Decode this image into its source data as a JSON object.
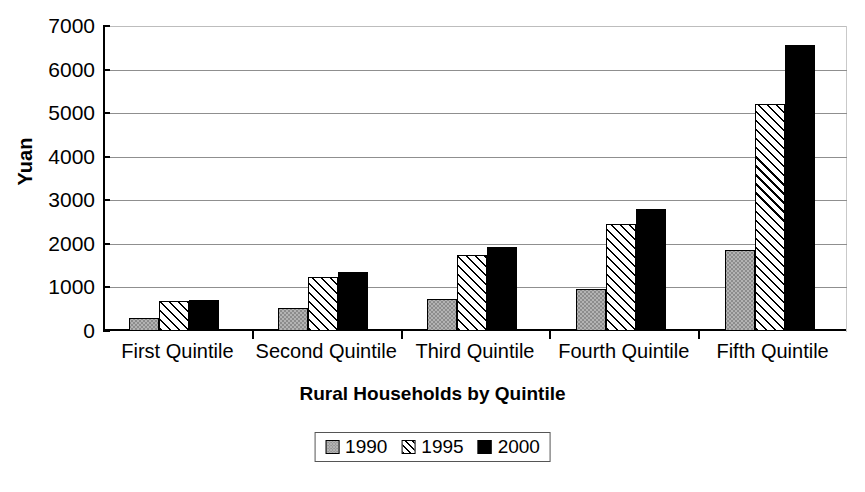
{
  "chart_data": {
    "type": "bar",
    "title": "",
    "xlabel": "Rural Households by Quintile",
    "ylabel": "Yuan",
    "categories": [
      "First Quintile",
      "Second Quintile",
      "Third Quintile",
      "Fourth Quintile",
      "Fifth Quintile"
    ],
    "series": [
      {
        "name": "1990",
        "values": [
          300,
          530,
          730,
          960,
          1870
        ]
      },
      {
        "name": "1995",
        "values": [
          690,
          1250,
          1740,
          2460,
          5220
        ]
      },
      {
        "name": "2000",
        "values": [
          710,
          1350,
          1920,
          2790,
          6570
        ]
      }
    ],
    "ylim": [
      0,
      7000
    ],
    "yticks": [
      0,
      1000,
      2000,
      3000,
      4000,
      5000,
      6000,
      7000
    ],
    "ytick_labels": [
      "0",
      "1000",
      "2000",
      "3000",
      "4000",
      "5000",
      "6000",
      "7000"
    ],
    "grid": "horizontal",
    "legend_position": "bottom-center",
    "colors": {
      "series_1990": "#b3b3b3",
      "series_1995": "#ffffff",
      "series_2000": "#000000",
      "axis": "#000000",
      "gridline": "#8f8f8f",
      "background": "#ffffff"
    }
  }
}
